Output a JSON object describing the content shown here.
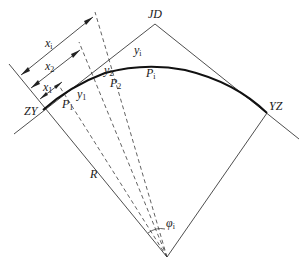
{
  "diagram": {
    "title": "",
    "type": "circular curve setting-out by tangent offset (perpendicular offset) method",
    "colors": {
      "line": "#3a3a3a",
      "curve": "#111111",
      "text": "#1a1a1a",
      "background": "#ffffff"
    },
    "points": {
      "jd": {
        "label": "JD"
      },
      "zy": {
        "label": "ZY"
      },
      "yz": {
        "label": "YZ"
      },
      "p1": {
        "label": "P",
        "sub": "1"
      },
      "p2": {
        "label": "P",
        "sub": "2"
      },
      "pi": {
        "label": "P",
        "sub": "i"
      }
    },
    "dimensions": {
      "xi": {
        "label": "x",
        "sub": "i"
      },
      "x2": {
        "label": "x",
        "sub": "2"
      },
      "x1": {
        "label": "x",
        "sub": "1"
      },
      "y1_near": {
        "label": "y",
        "sub": "1"
      },
      "y2": {
        "label": "y",
        "sub": "2"
      },
      "yi": {
        "label": "y",
        "sub": "i"
      }
    },
    "radius": {
      "label": "R"
    },
    "angle": {
      "label": "φ",
      "sub": "i"
    }
  }
}
